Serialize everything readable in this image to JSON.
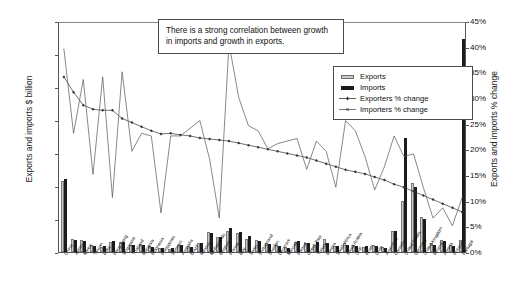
{
  "chart_data": {
    "type": "bar",
    "title": "",
    "ylabel": "Exports and imports $ billion",
    "y2label": "Exports and imports % change",
    "xlabel": "",
    "ylim": [
      0,
      1400
    ],
    "y2lim": [
      0,
      45
    ],
    "grid": false,
    "legend_position": "upper-right",
    "yticks": [
      "0",
      "200",
      "400",
      "600",
      "800",
      "1,000",
      "1,200",
      "1,400"
    ],
    "y2ticks": [
      "0%",
      "5%",
      "10%",
      "15%",
      "20%",
      "25%",
      "30%",
      "35%",
      "40%",
      "45%"
    ],
    "categories": [
      "China",
      "Japan",
      "Korea",
      "Taiwan",
      "India",
      "Hong Kong",
      "Singapore",
      "Thailand",
      "Malaysia",
      "Indonesia",
      "Philippines",
      "Vietnam",
      "Australia",
      "Brazil",
      "Mexico",
      "Netherlands",
      "Belgium",
      "France",
      "Italy",
      "Spain",
      "Switzerland",
      "Sweden",
      "Denmark",
      "Norway",
      "Poland",
      "Czech Rep",
      "Turkey",
      "Russia",
      "South Africa",
      "Saudi Arabia",
      "UAE",
      "Israel",
      "Chile",
      "Argentina",
      "Canada",
      "United States",
      "Germany",
      "United Kingdom",
      "Ireland",
      "Austria",
      "Finland",
      "Portugal"
    ],
    "series": [
      {
        "name": "Exports",
        "axis": "left",
        "unit": "$ billion",
        "color": "#c9c9c9",
        "values": [
          430,
          80,
          72,
          40,
          30,
          60,
          62,
          40,
          46,
          34,
          24,
          20,
          40,
          36,
          52,
          120,
          94,
          130,
          118,
          78,
          70,
          56,
          40,
          30,
          60,
          56,
          40,
          78,
          34,
          56,
          44,
          30,
          40,
          30,
          130,
          310,
          420,
          214,
          52,
          70,
          40,
          72
        ]
      },
      {
        "name": "Imports",
        "axis": "left",
        "unit": "$ billion",
        "color": "#1c1c1c",
        "values": [
          440,
          72,
          68,
          34,
          38,
          64,
          58,
          42,
          42,
          28,
          22,
          24,
          44,
          30,
          56,
          114,
          88,
          145,
          120,
          96,
          64,
          50,
          36,
          24,
          66,
          52,
          58,
          56,
          38,
          40,
          38,
          34,
          34,
          24,
          128,
          694,
          392,
          200,
          44,
          66,
          36,
          1290
        ]
      },
      {
        "name": "Exporters % change",
        "axis": "right",
        "unit": "%",
        "color": "#333333",
        "marker": "diamond",
        "values": [
          34.5,
          31.5,
          29.0,
          28.2,
          28.0,
          28.0,
          26.4,
          25.6,
          24.8,
          24.0,
          23.4,
          23.5,
          23.2,
          23.0,
          22.6,
          22.4,
          22.2,
          22.0,
          21.6,
          21.2,
          20.8,
          20.4,
          20.0,
          19.6,
          19.2,
          18.8,
          18.2,
          17.6,
          17.0,
          16.4,
          16.0,
          15.6,
          15.0,
          14.4,
          13.6,
          13.0,
          12.2,
          11.4,
          10.6,
          9.8,
          9.0,
          8.2
        ]
      },
      {
        "name": "Importers % change",
        "axis": "right",
        "unit": "%",
        "color": "#555555",
        "marker": "dash",
        "values": [
          40.0,
          23.5,
          34.0,
          15.5,
          34.5,
          11.0,
          35.5,
          20.0,
          23.5,
          23.0,
          8.0,
          23.0,
          23.0,
          24.5,
          26.0,
          18.5,
          7.0,
          41.0,
          30.5,
          25.0,
          24.0,
          20.5,
          21.5,
          22.0,
          22.5,
          16.5,
          22.0,
          20.0,
          13.0,
          26.0,
          24.0,
          19.0,
          12.5,
          17.0,
          23.0,
          19.0,
          19.5,
          13.0,
          7.0,
          9.0,
          5.5,
          11.0
        ]
      }
    ],
    "annotations": [
      {
        "name": "correlation-note",
        "text": "There is a strong correlation between growth in imports and growth in exports."
      }
    ]
  },
  "legend": {
    "items": [
      {
        "label": "Exports",
        "key": "swatch-light"
      },
      {
        "label": "Imports",
        "key": "swatch-dark"
      },
      {
        "label": "Exporters % change",
        "key": "line-diamond"
      },
      {
        "label": "Importers % change",
        "key": "line-dash"
      }
    ]
  }
}
